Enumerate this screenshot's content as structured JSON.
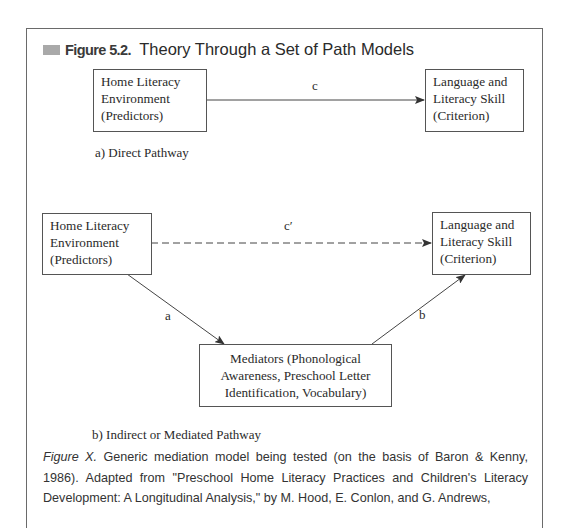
{
  "figure": {
    "number": "Figure 5.2.",
    "title": "Theory Through a Set of Path Models",
    "accent_square_color": "#a9a9a9"
  },
  "panel_a": {
    "predictor_box": [
      "Home Literacy",
      "Environment",
      "(Predictors)"
    ],
    "criterion_box": [
      "Language and",
      "Literacy Skill",
      "(Criterion)"
    ],
    "path_label": "c",
    "subtitle": "a) Direct Pathway"
  },
  "panel_b": {
    "predictor_box": [
      "Home Literacy",
      "Environment",
      "(Predictors)"
    ],
    "criterion_box": [
      "Language and",
      "Literacy Skill",
      "(Criterion)"
    ],
    "mediator_box": [
      "Mediators (Phonological",
      "Awareness, Preschool Letter",
      "Identification, Vocabulary)"
    ],
    "direct_path_label": "c′",
    "path_a_label": "a",
    "path_b_label": "b",
    "subtitle": "b) Indirect or Mediated Pathway"
  },
  "caption": {
    "lead": "Figure X.",
    "text": " Generic mediation model being tested (on the basis of Baron & Kenny, 1986). Adapted from \"Preschool Home Literacy Practices and Children's Literacy Development: A Longitudinal Analysis,\" by M. Hood, E. Conlon, and G. Andrews,"
  }
}
